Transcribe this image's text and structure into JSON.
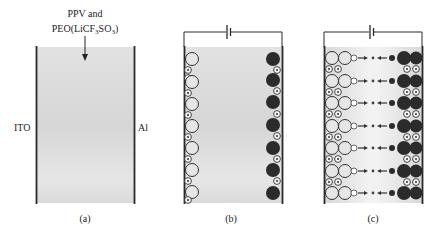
{
  "figure": {
    "panels": [
      {
        "id": "a",
        "caption": "(a)",
        "material_label_line1": "PPV and",
        "material_label_line2_prefix": "PEO(LiCF",
        "material_label_sub1": "3",
        "material_label_mid": "SO",
        "material_label_sub2": "3",
        "material_label_suffix": ")",
        "left_electrode": "ITO",
        "right_electrode": "Al"
      },
      {
        "id": "b",
        "caption": "(b)",
        "description": "Bias applied: anions accumulate at ITO side (open circles), cations at Al side (filled circles)"
      },
      {
        "id": "c",
        "caption": "(c)",
        "description": "Electrochemical doping: p-doped and n-doped regions with carrier injection forming p-i-n junction"
      }
    ],
    "colors": {
      "film": "#dcdcdc",
      "electrode": "#2a2a2a",
      "anion_fill": "#e4e4e4",
      "cation_fill": "#2b2b2b",
      "background": "#ffffff"
    }
  }
}
